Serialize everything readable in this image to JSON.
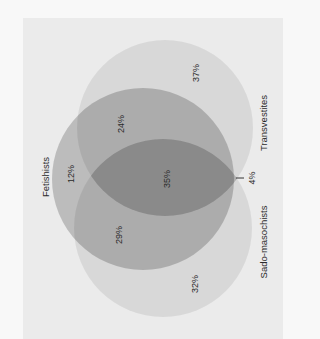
{
  "diagram": {
    "type": "venn",
    "sets": [
      {
        "id": "fetishists",
        "label": "Fetishists"
      },
      {
        "id": "transvestites",
        "label": "Transvestites"
      },
      {
        "id": "sadomasochists",
        "label": "Sado-masochists"
      }
    ],
    "regions": {
      "transvestites_only": "37%",
      "fetishists_transvestites": "24%",
      "fetishists_only": "12%",
      "all_three": "35%",
      "fetishists_sadomasochists": "29%",
      "sadomasochists_only": "32%",
      "transvestites_sadomasochists": "4%"
    },
    "colors": {
      "page_background": "#f8f8f8",
      "panel_background": "#ebebeb",
      "text": "#2a2a2a",
      "tick": "#333333"
    }
  }
}
